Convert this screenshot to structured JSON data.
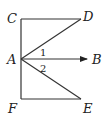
{
  "diagram": {
    "points": {
      "C": {
        "label": "C",
        "x": 21,
        "y": 19
      },
      "D": {
        "label": "D",
        "x": 81,
        "y": 19
      },
      "A": {
        "label": "A",
        "x": 21,
        "y": 59
      },
      "B": {
        "label": "B",
        "x": 88,
        "y": 59
      },
      "F": {
        "label": "F",
        "x": 21,
        "y": 99
      },
      "E": {
        "label": "E",
        "x": 81,
        "y": 99
      }
    },
    "segments": [
      {
        "from": "C",
        "to": "F",
        "type": "segment"
      },
      {
        "from": "C",
        "to": "D",
        "type": "segment"
      },
      {
        "from": "A",
        "to": "D",
        "type": "segment"
      },
      {
        "from": "A",
        "to": "B",
        "type": "ray"
      },
      {
        "from": "A",
        "to": "E",
        "type": "segment"
      },
      {
        "from": "F",
        "to": "E",
        "type": "segment"
      }
    ],
    "angles": [
      {
        "label": "1",
        "between": [
          "AD",
          "AB"
        ]
      },
      {
        "label": "2",
        "between": [
          "AB",
          "AE"
        ]
      }
    ],
    "stroke_color": "#333333"
  }
}
